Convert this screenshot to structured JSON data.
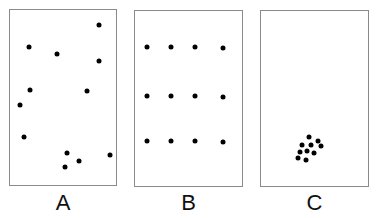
{
  "figure": {
    "dot_color": "#000000",
    "border_color": "#8a8a8a",
    "panels": [
      {
        "label": "A",
        "pattern": "random",
        "box": {
          "left": 9,
          "top": 9,
          "width": 108,
          "height": 177
        },
        "dots": [
          [
            29,
            47
          ],
          [
            57,
            54
          ],
          [
            99,
            25
          ],
          [
            99,
            61
          ],
          [
            30,
            90
          ],
          [
            87,
            91
          ],
          [
            20,
            105
          ],
          [
            24,
            137
          ],
          [
            67,
            153
          ],
          [
            110,
            155
          ],
          [
            79,
            161
          ],
          [
            65,
            167
          ]
        ]
      },
      {
        "label": "B",
        "pattern": "uniform",
        "box": {
          "left": 134,
          "top": 10,
          "width": 109,
          "height": 177
        },
        "dots": [
          [
            147,
            47
          ],
          [
            171,
            47
          ],
          [
            195,
            47
          ],
          [
            223,
            48
          ],
          [
            147,
            96
          ],
          [
            171,
            96
          ],
          [
            195,
            96
          ],
          [
            223,
            97
          ],
          [
            147,
            141
          ],
          [
            171,
            141
          ],
          [
            195,
            141
          ],
          [
            223,
            142
          ]
        ]
      },
      {
        "label": "C",
        "pattern": "clustered",
        "box": {
          "left": 260,
          "top": 10,
          "width": 109,
          "height": 177
        },
        "dots": [
          [
            309,
            137
          ],
          [
            318,
            141
          ],
          [
            302,
            145
          ],
          [
            311,
            145
          ],
          [
            321,
            146
          ],
          [
            300,
            152
          ],
          [
            307,
            151
          ],
          [
            314,
            153
          ],
          [
            298,
            158
          ],
          [
            306,
            160
          ]
        ]
      }
    ]
  }
}
